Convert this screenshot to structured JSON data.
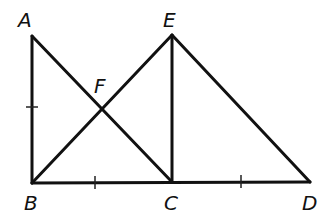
{
  "diagram": {
    "points": {
      "A": {
        "label": "A",
        "x": 32,
        "y": 36,
        "lx": 18,
        "ly": 27
      },
      "B": {
        "label": "B",
        "x": 32,
        "y": 183,
        "lx": 24,
        "ly": 210
      },
      "C": {
        "label": "C",
        "x": 172,
        "y": 182,
        "lx": 164,
        "ly": 210
      },
      "D": {
        "label": "D",
        "x": 310,
        "y": 182,
        "lx": 302,
        "ly": 210
      },
      "E": {
        "label": "E",
        "x": 172,
        "y": 35,
        "lx": 163,
        "ly": 27
      },
      "F": {
        "label": "F",
        "x": 102,
        "y": 107,
        "lx": 94,
        "ly": 93
      }
    },
    "segments": [
      "AB",
      "AC",
      "BE",
      "EC",
      "ED",
      "BC",
      "CD"
    ],
    "tick_marks": [
      {
        "on": "AB",
        "count": 1
      },
      {
        "on": "BC",
        "count": 1
      },
      {
        "on": "CD",
        "count": 1
      }
    ]
  }
}
